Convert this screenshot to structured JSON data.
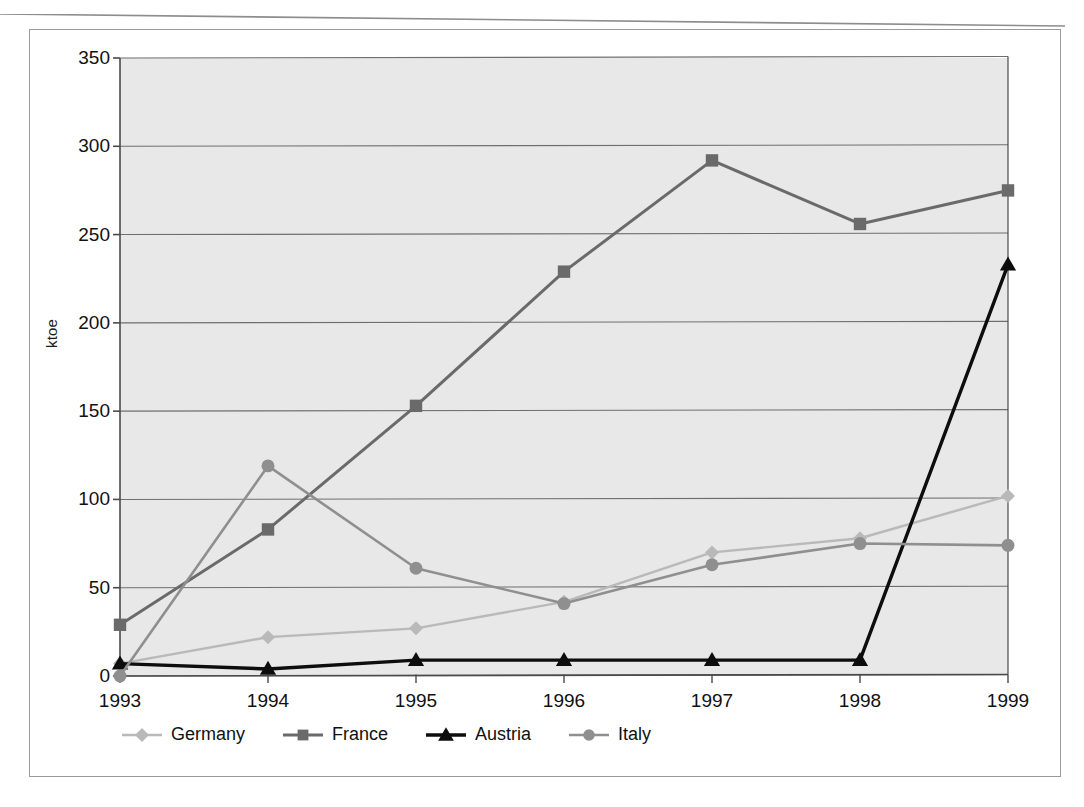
{
  "figure": {
    "y_axis_title": "ktoe",
    "y_ticks": [
      "0",
      "50",
      "100",
      "150",
      "200",
      "250",
      "300",
      "350"
    ],
    "x_ticks": [
      "1993",
      "1994",
      "1995",
      "1996",
      "1997",
      "1998",
      "1999"
    ]
  },
  "legend": {
    "items": [
      {
        "label": "Germany",
        "color": "#b9b9b9",
        "marker": "diamond-marker"
      },
      {
        "label": "France",
        "color": "#6a6a6a",
        "marker": "square-marker"
      },
      {
        "label": "Austria",
        "color": "#0d0d0d",
        "marker": "triangle-marker"
      },
      {
        "label": "Italy",
        "color": "#8f8f8f",
        "marker": "circle-marker"
      }
    ]
  },
  "colors": {
    "plot_background": "#e8e8e8",
    "gridline": "#6f6f6f",
    "axis": "#4a4a4a",
    "frame": "#9a9a9a",
    "text": "#111111"
  },
  "chart_data": {
    "type": "line",
    "title": "",
    "xlabel": "",
    "ylabel": "ktoe",
    "categories": [
      "1993",
      "1994",
      "1995",
      "1996",
      "1997",
      "1998",
      "1999"
    ],
    "ylim": [
      0,
      350
    ],
    "ytick_step": 50,
    "grid": "horizontal",
    "legend_position": "bottom",
    "series": [
      {
        "name": "Germany",
        "color": "#b9b9b9",
        "marker": "diamond",
        "values": [
          7,
          22,
          27,
          42,
          70,
          78,
          102
        ]
      },
      {
        "name": "France",
        "color": "#6a6a6a",
        "marker": "square",
        "values": [
          29,
          83,
          153,
          229,
          292,
          256,
          275
        ]
      },
      {
        "name": "Austria",
        "color": "#0d0d0d",
        "marker": "triangle",
        "values": [
          7,
          4,
          9,
          9,
          9,
          9,
          233
        ]
      },
      {
        "name": "Italy",
        "color": "#8f8f8f",
        "marker": "circle",
        "values": [
          0,
          119,
          61,
          41,
          63,
          75,
          74
        ]
      }
    ]
  }
}
